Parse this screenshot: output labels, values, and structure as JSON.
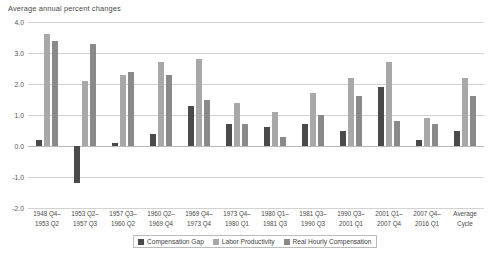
{
  "chart_data": {
    "type": "bar",
    "title": "Average annual percent changes",
    "xlabel": "",
    "ylabel": "",
    "ylim": [
      -2.0,
      4.0
    ],
    "yticks": [
      4.0,
      3.0,
      2.0,
      1.0,
      0.0,
      -1.0,
      -2.0
    ],
    "ytick_labels": [
      "4.0",
      "3.0",
      "2.0",
      "1.0",
      "0.0",
      "-1.0",
      "-2.0"
    ],
    "grid": true,
    "legend_position": "bottom",
    "categories": [
      "1948 Q4–1953 Q2",
      "1953 Q2–1957 Q3",
      "1957 Q3–1960 Q2",
      "1960 Q2–1969 Q4",
      "1969 Q4–1973 Q4",
      "1973 Q4–1980 Q1",
      "1980 Q1–1981 Q3",
      "1981 Q3–1990 Q3",
      "1990 Q3–2001 Q1",
      "2001 Q1–2007 Q4",
      "2007 Q4–2016 Q1",
      "Average Cycle"
    ],
    "category_lines": [
      [
        "1948 Q4–",
        "1953 Q2"
      ],
      [
        "1953 Q2–",
        "1957 Q3"
      ],
      [
        "1957 Q3–",
        "1960 Q2"
      ],
      [
        "1960 Q2–",
        "1969 Q4"
      ],
      [
        "1969 Q4–",
        "1973 Q4"
      ],
      [
        "1973 Q4–",
        "1980 Q1"
      ],
      [
        "1980 Q1–",
        "1981 Q3"
      ],
      [
        "1981 Q3–",
        "1990 Q3"
      ],
      [
        "1990 Q3–",
        "2001 Q1"
      ],
      [
        "2001 Q1–",
        "2007 Q4"
      ],
      [
        "2007 Q4–",
        "2016 Q1"
      ],
      [
        "Average",
        "Cycle"
      ]
    ],
    "series": [
      {
        "name": "Compensation Gap",
        "color": "#4a4a4a",
        "values": [
          0.2,
          -1.2,
          0.1,
          0.4,
          1.3,
          0.7,
          0.6,
          0.7,
          0.5,
          1.9,
          0.2,
          0.5
        ]
      },
      {
        "name": "Labor Productivity",
        "color": "#a8a8a8",
        "values": [
          3.6,
          2.1,
          2.3,
          2.7,
          2.8,
          1.4,
          1.1,
          1.7,
          2.2,
          2.7,
          0.9,
          2.2
        ]
      },
      {
        "name": "Real Hourly Compensation",
        "color": "#8a8a8a",
        "values": [
          3.4,
          3.3,
          2.4,
          2.3,
          1.5,
          0.7,
          0.3,
          1.0,
          1.6,
          0.8,
          0.7,
          1.6
        ]
      }
    ]
  },
  "legend": {
    "items": [
      {
        "label": "Compensation Gap"
      },
      {
        "label": "Labor Productivity"
      },
      {
        "label": "Real Hourly Compensation"
      }
    ]
  }
}
